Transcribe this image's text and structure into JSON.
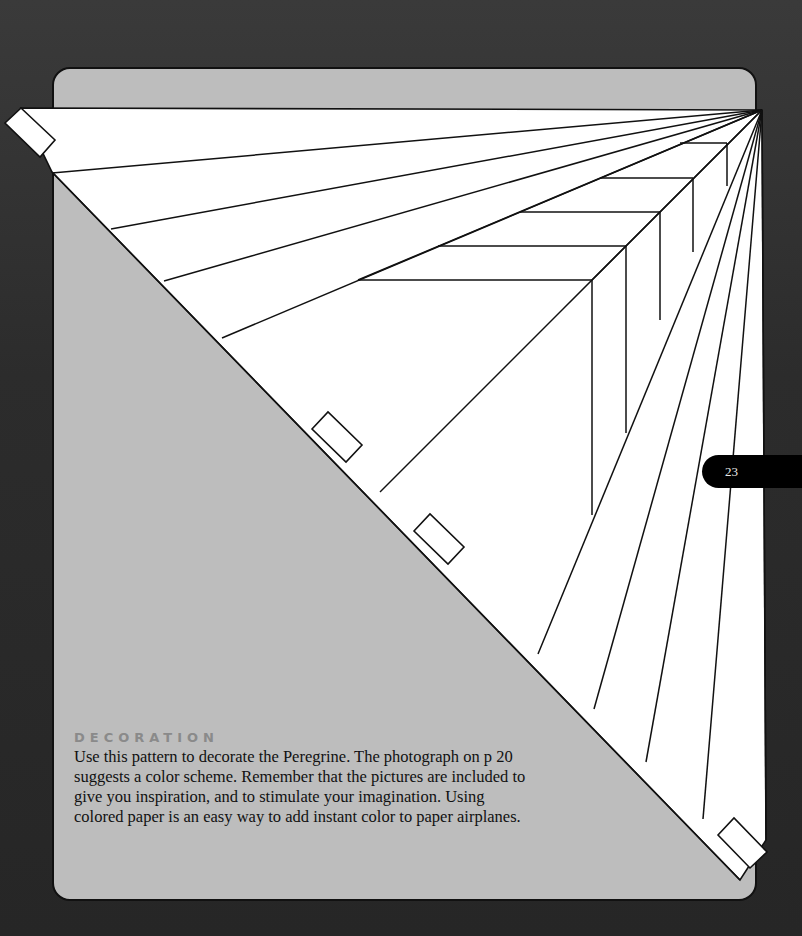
{
  "page": {
    "number": "23",
    "colors": {
      "background": "#2e2e2e",
      "card": "#bdbdbd",
      "pattern_fill": "#ffffff",
      "line": "#111111",
      "heading": "#8a8a8a",
      "page_tab": "#000000"
    }
  },
  "decoration": {
    "heading": "DECORATION",
    "lines": [
      "Use this pattern to decorate the Peregrine. The photograph on p 20",
      "suggests a color scheme. Remember that the pictures are included to",
      "give you inspiration, and to stimulate your imagination. Using",
      "colored paper is an easy way to add instant color to paper airplanes."
    ]
  },
  "pattern": {
    "description": "Paper airplane decoration pattern with radiating lines from top-right apex and nested chevron stripes",
    "tabs": [
      "top-left-tab",
      "fold-tab-1",
      "fold-tab-2",
      "bottom-right-tab"
    ]
  }
}
